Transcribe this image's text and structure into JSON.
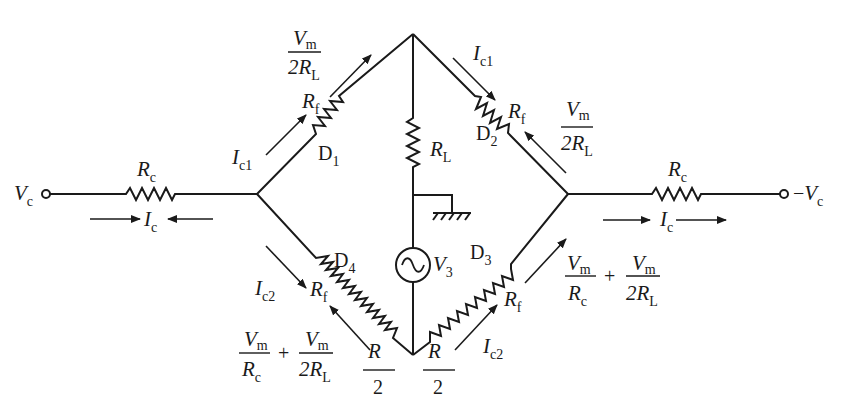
{
  "diagram": {
    "type": "bridge-rectifier-circuit",
    "terminals": {
      "left": {
        "symbol": "V",
        "sub": "c"
      },
      "right": {
        "prefix": "−",
        "symbol": "V",
        "sub": "c"
      }
    },
    "series_resistors": {
      "left": {
        "symbol": "R",
        "sub": "c"
      },
      "right": {
        "symbol": "R",
        "sub": "c"
      }
    },
    "line_currents": {
      "left": {
        "symbol": "I",
        "sub": "c"
      },
      "right": {
        "symbol": "I",
        "sub": "c"
      }
    },
    "load": {
      "symbol": "R",
      "sub": "L"
    },
    "source": {
      "symbol": "V",
      "sub": "3",
      "icon": "ac-source-icon"
    },
    "ground": {
      "icon": "ground-icon"
    },
    "diodes": [
      {
        "name": "D",
        "sub": "1",
        "rf": {
          "symbol": "R",
          "sub": "f"
        },
        "current": {
          "symbol": "I",
          "sub": "c1"
        },
        "reverse": {
          "num": "V",
          "num_sub": "m",
          "den": "2R",
          "den_sub": "L"
        }
      },
      {
        "name": "D",
        "sub": "2",
        "rf": {
          "symbol": "R",
          "sub": "f"
        },
        "current": {
          "symbol": "I",
          "sub": "c1"
        },
        "reverse": {
          "num": "V",
          "num_sub": "m",
          "den": "2R",
          "den_sub": "L"
        }
      },
      {
        "name": "D",
        "sub": "3",
        "rf": {
          "symbol": "R",
          "sub": "f"
        },
        "current": {
          "symbol": "I",
          "sub": "c2"
        },
        "reverse": {
          "t1_num": "V",
          "t1_num_sub": "m",
          "t1_den": "R",
          "t1_den_sub": "c",
          "plus": "+",
          "t2_num": "V",
          "t2_num_sub": "m",
          "t2_den": "2R",
          "t2_den_sub": "L"
        }
      },
      {
        "name": "D",
        "sub": "4",
        "rf": {
          "symbol": "R",
          "sub": "f"
        },
        "current": {
          "symbol": "I",
          "sub": "c2"
        },
        "reverse": {
          "t1_num": "V",
          "t1_num_sub": "m",
          "t1_den": "R",
          "t1_den_sub": "c",
          "plus": "+",
          "t2_num": "V",
          "t2_num_sub": "m",
          "t2_den": "2R",
          "t2_den_sub": "L"
        }
      }
    ],
    "half_resistors": [
      {
        "num": "R",
        "den": "2"
      },
      {
        "num": "R",
        "den": "2"
      }
    ]
  }
}
